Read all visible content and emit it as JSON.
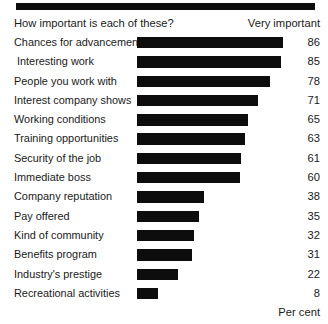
{
  "header": {
    "question": "How important is each of these?",
    "legend": "Very important"
  },
  "footer": {
    "unit": "Per cent"
  },
  "style": {
    "bar_color": "#0d0d0d",
    "background": "#ffffff",
    "text_color": "#1a1a1a"
  },
  "chart_data": {
    "type": "bar",
    "orientation": "horizontal",
    "title": "How important is each of these?",
    "subtitle": "",
    "xlabel": "Per cent",
    "ylabel": "",
    "legend_entries": [
      "Very important"
    ],
    "legend_position": "top-right",
    "grid": false,
    "xlim": [
      0,
      86
    ],
    "value_suffix": "",
    "categories": [
      "Chances for advancement",
      "Interesting work",
      "People you work with",
      "Interest company shows",
      "Working conditions",
      "Training opportunities",
      "Security of the job",
      "Immediate boss",
      "Company reputation",
      "Pay offered",
      "Kind of community",
      "Benefits program",
      "Industry's prestige",
      "Recreational activities"
    ],
    "values": [
      86,
      85,
      78,
      71,
      65,
      63,
      61,
      60,
      38,
      35,
      32,
      31,
      22,
      8
    ],
    "rows": [
      {
        "label": "Chances for advancement",
        "value": 86,
        "value_text": "86",
        "bar_px": 146
      },
      {
        "label": "Interesting work",
        "value": 85,
        "value_text": "85",
        "bar_px": 144
      },
      {
        "label": "People you work with",
        "value": 78,
        "value_text": "78",
        "bar_px": 133
      },
      {
        "label": "Interest company shows",
        "value": 71,
        "value_text": "71",
        "bar_px": 121
      },
      {
        "label": "Working conditions",
        "value": 65,
        "value_text": "65",
        "bar_px": 111
      },
      {
        "label": "Training opportunities",
        "value": 63,
        "value_text": "63",
        "bar_px": 108
      },
      {
        "label": "Security of the job",
        "value": 61,
        "value_text": "61",
        "bar_px": 104
      },
      {
        "label": "Immediate boss",
        "value": 60,
        "value_text": "60",
        "bar_px": 103
      },
      {
        "label": "Company reputation",
        "value": 38,
        "value_text": "38",
        "bar_px": 67
      },
      {
        "label": "Pay offered",
        "value": 35,
        "value_text": "35",
        "bar_px": 62
      },
      {
        "label": "Kind of community",
        "value": 32,
        "value_text": "32",
        "bar_px": 57
      },
      {
        "label": "Benefits program",
        "value": 31,
        "value_text": "31",
        "bar_px": 55
      },
      {
        "label": "Industry's prestige",
        "value": 22,
        "value_text": "22",
        "bar_px": 41
      },
      {
        "label": "Recreational activities",
        "value": 8,
        "value_text": "8",
        "bar_px": 21
      }
    ]
  }
}
